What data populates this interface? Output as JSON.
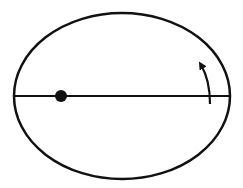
{
  "diagram": {
    "stroke_color": "#111111",
    "background": "#ffffff",
    "ellipse": {
      "cx": 122,
      "cy": 96,
      "rx": 108,
      "ry": 83,
      "stroke_width": 2.5
    },
    "major_axis": {
      "x1": 14,
      "y1": 96,
      "x2": 230,
      "y2": 96,
      "stroke_width": 2
    },
    "focus_point": {
      "cx": 61,
      "cy": 96,
      "r": 6
    },
    "rotation_arrow": {
      "direction": "counterclockwise",
      "start": [
        210,
        104
      ],
      "end": [
        202,
        64
      ]
    }
  }
}
